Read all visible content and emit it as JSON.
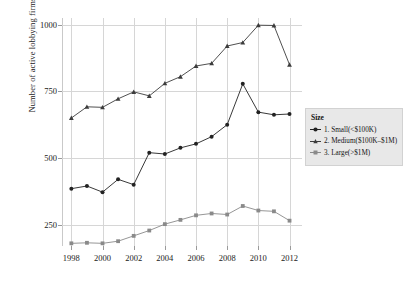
{
  "chart_data": {
    "type": "line",
    "title": "",
    "xlabel": "",
    "ylabel": "Number of active lobbying firms",
    "x": [
      1998,
      1999,
      2000,
      2001,
      2002,
      2003,
      2004,
      2005,
      2006,
      2007,
      2008,
      2009,
      2010,
      2011,
      2012
    ],
    "xlim": [
      1997.4,
      2012.8
    ],
    "ylim": [
      170,
      1025
    ],
    "xticks": [
      1998,
      2000,
      2002,
      2004,
      2006,
      2008,
      2010,
      2012
    ],
    "xtick_labels": [
      "1998",
      "2000",
      "2002",
      "2004",
      "2006",
      "2008",
      "2010",
      "2012"
    ],
    "yticks": [
      250,
      500,
      750,
      1000
    ],
    "ytick_labels": [
      "250",
      "500",
      "750",
      "1000"
    ],
    "grid": true,
    "legend_position": "right",
    "legend_title": "Size",
    "series": [
      {
        "name": "1. Small(<$100K)",
        "marker": "circle",
        "color": "#222222",
        "values": [
          385,
          395,
          372,
          420,
          400,
          520,
          515,
          538,
          553,
          580,
          625,
          778,
          672,
          662,
          665
        ]
      },
      {
        "name": "2. Medium($100K–$1M)",
        "marker": "triangle",
        "color": "#3c3c3c",
        "values": [
          650,
          692,
          690,
          722,
          748,
          733,
          780,
          805,
          845,
          855,
          920,
          933,
          998,
          997,
          850
        ]
      },
      {
        "name": "3. Large(>$1M)",
        "marker": "square",
        "color": "#8a8a8a",
        "values": [
          180,
          182,
          180,
          188,
          208,
          228,
          252,
          268,
          285,
          292,
          288,
          320,
          303,
          300,
          265
        ]
      }
    ]
  },
  "legend": {
    "title": "Size",
    "entries": [
      {
        "label": "1. Small(<$100K)",
        "marker": "circle-marker-icon"
      },
      {
        "label": "2. Medium($100K–$1M)",
        "marker": "triangle-marker-icon"
      },
      {
        "label": "3. Large(>$1M)",
        "marker": "square-marker-icon"
      }
    ]
  },
  "axes": {
    "y_title": "Number of active lobbying firms"
  },
  "colors": {
    "grid": "#d6d6d6",
    "axis": "#9a9a9a",
    "background": "#ffffff",
    "legend_background": "#e8e8e8",
    "text": "#1a1a1a"
  }
}
